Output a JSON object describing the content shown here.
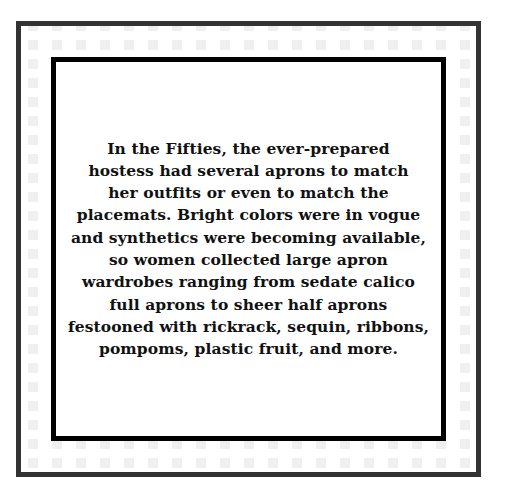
{
  "frame": {
    "outer_border_color": "#333333",
    "inner_border_color": "#000000",
    "pattern_color": "#ececec",
    "background_color": "#ffffff"
  },
  "quote": {
    "lines": [
      "In the Fifties, the ever-prepared",
      "hostess had several aprons to match",
      "her outfits or even to match the",
      "placemats. Bright colors were in vogue",
      "and synthetics were becoming available,",
      "so women collected large apron",
      "wardrobes ranging from sedate calico",
      "full aprons to sheer half aprons",
      "festooned with rickrack, sequin, ribbons,",
      "pompoms, plastic fruit, and more."
    ]
  }
}
